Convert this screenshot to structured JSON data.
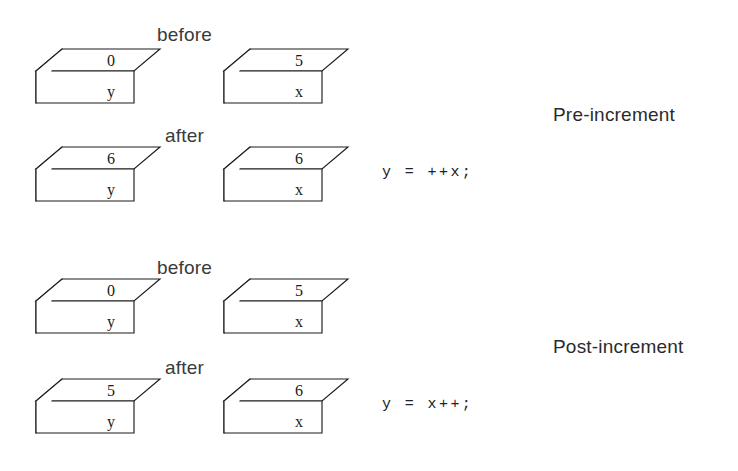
{
  "diagram": {
    "stroke_color": "#1d1d1d",
    "fill_color": "#ffffff",
    "background_color": "#ffffff"
  },
  "sections": [
    {
      "label": "Pre-increment",
      "code": "y = ++x;",
      "rows": [
        {
          "label": "before",
          "boxes": [
            {
              "value": "0",
              "name": "y"
            },
            {
              "value": "5",
              "name": "x"
            }
          ]
        },
        {
          "label": "after",
          "boxes": [
            {
              "value": "6",
              "name": "y"
            },
            {
              "value": "6",
              "name": "x"
            }
          ]
        }
      ]
    },
    {
      "label": "Post-increment",
      "code": "y = x++;",
      "rows": [
        {
          "label": "before",
          "boxes": [
            {
              "value": "0",
              "name": "y"
            },
            {
              "value": "5",
              "name": "x"
            }
          ]
        },
        {
          "label": "after",
          "boxes": [
            {
              "value": "5",
              "name": "y"
            },
            {
              "value": "6",
              "name": "x"
            }
          ]
        }
      ]
    }
  ]
}
